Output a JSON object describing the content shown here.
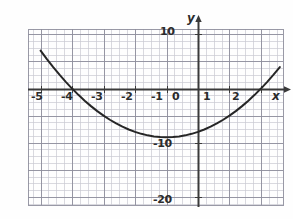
{
  "figure": {
    "background_color": "#fefefe",
    "width": 293,
    "height": 219
  },
  "axes": {
    "x_axis_label": "x",
    "y_axis_label": "y",
    "axis_color": "#3a3a3a",
    "minor_grid_color": "#c9c9d2",
    "major_grid_color": "#8e8e9c",
    "curve_color": "#262626"
  },
  "x_tick_labels": [
    {
      "text": "-5",
      "value": -5,
      "px_x": 31,
      "px_y": 91
    },
    {
      "text": "-4",
      "value": -4,
      "px_x": 61,
      "px_y": 91
    },
    {
      "text": "-3",
      "value": -3,
      "px_x": 91,
      "px_y": 91
    },
    {
      "text": "-2",
      "value": -2,
      "px_x": 121,
      "px_y": 91
    },
    {
      "text": "-1",
      "value": -1,
      "px_x": 151,
      "px_y": 91
    },
    {
      "text": "0",
      "value": 0,
      "px_x": 172,
      "px_y": 91
    },
    {
      "text": "1",
      "value": 1,
      "px_x": 203,
      "px_y": 91
    },
    {
      "text": "2",
      "value": 2,
      "px_x": 232,
      "px_y": 91
    }
  ],
  "y_tick_labels": [
    {
      "text": "10",
      "value": 10,
      "px_x": 160,
      "px_y": 26
    },
    {
      "text": "-10",
      "value": -10,
      "px_x": 153,
      "px_y": 138
    },
    {
      "text": "-20",
      "value": -20,
      "px_x": 153,
      "px_y": 194
    }
  ],
  "chart_data": {
    "type": "line",
    "title": "",
    "xlabel": "x",
    "ylabel": "y",
    "grid": true,
    "legend": "none",
    "xlim": [
      -5.4,
      2.7
    ],
    "ylim": [
      -21.5,
      11
    ],
    "xticks": [
      -5,
      -4,
      -3,
      -2,
      -1,
      0,
      1,
      2
    ],
    "yticks": [
      10,
      -10,
      -20
    ],
    "minor_grid_step_x": 0.25,
    "minor_grid_step_y": 1.25,
    "series": [
      {
        "name": "parabola",
        "equation": "y = x^2 + 2x - 8",
        "roots": [
          -4,
          2
        ],
        "vertex": [
          -1,
          -9
        ],
        "y_intercept": -8,
        "x": [
          -5.0,
          -4.8,
          -4.6,
          -4.4,
          -4.2,
          -4.0,
          -3.8,
          -3.6,
          -3.4,
          -3.2,
          -3.0,
          -2.8,
          -2.6,
          -2.4,
          -2.2,
          -2.0,
          -1.8,
          -1.6,
          -1.4,
          -1.2,
          -1.0,
          -0.8,
          -0.6,
          -0.4,
          -0.2,
          0.0,
          0.2,
          0.4,
          0.6,
          0.8,
          1.0,
          1.2,
          1.4,
          1.6,
          1.8,
          2.0,
          2.2,
          2.4,
          2.6
        ],
        "y": [
          7.0,
          5.44,
          3.96,
          2.56,
          1.24,
          0.0,
          -1.16,
          -2.24,
          -3.24,
          -4.16,
          -5.0,
          -5.76,
          -6.44,
          -7.04,
          -7.56,
          -8.0,
          -8.36,
          -8.64,
          -8.84,
          -8.96,
          -9.0,
          -8.96,
          -8.84,
          -8.64,
          -8.36,
          -8.0,
          -7.56,
          -7.04,
          -6.44,
          -5.76,
          -5.0,
          -4.16,
          -3.24,
          -2.24,
          -1.16,
          0.0,
          1.24,
          2.56,
          3.96
        ]
      }
    ]
  }
}
